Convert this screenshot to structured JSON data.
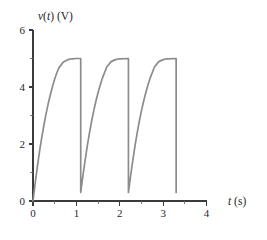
{
  "chart_data": {
    "type": "line",
    "title": "",
    "subtitle": "",
    "xlabel": "t (s)",
    "ylabel": "v(t) (V)",
    "xlabel_parts": {
      "italic": "t",
      "rest": " (s)"
    },
    "ylabel_parts": {
      "italic_v": "v",
      "paren_t_open": "(",
      "italic_t": "t",
      "paren_t_close": ")",
      "unit": " (V)"
    },
    "xlim": [
      0,
      4
    ],
    "ylim": [
      0,
      6
    ],
    "x_ticks_major": [
      0,
      1,
      2,
      3,
      4
    ],
    "x_ticks_major_labels": [
      "0",
      "1",
      "2",
      "3",
      "4"
    ],
    "x_ticks_minor": [
      0.5,
      1.5,
      2.5,
      3.5
    ],
    "y_ticks_major": [
      0,
      2,
      4,
      6
    ],
    "y_ticks_major_labels": [
      "0",
      "2",
      "4",
      "6"
    ],
    "y_ticks_minor": [
      1,
      3,
      5
    ],
    "grid": false,
    "legend": null,
    "series": [
      {
        "name": "v(t)",
        "color": "#8c8c8c",
        "waveform": "sawtooth-exponential-charge",
        "period": 1.1,
        "peak_value": 5.0,
        "reset_value": 0.3,
        "start_value": 0.0,
        "time_constant": 0.62,
        "n_cycles": 3,
        "end_time": 3.3,
        "points": [
          [
            0.0,
            0.0
          ],
          [
            0.05,
            0.62
          ],
          [
            0.1,
            1.2
          ],
          [
            0.15,
            1.73
          ],
          [
            0.2,
            2.21
          ],
          [
            0.25,
            2.65
          ],
          [
            0.3,
            3.05
          ],
          [
            0.35,
            3.41
          ],
          [
            0.4,
            3.73
          ],
          [
            0.45,
            4.02
          ],
          [
            0.5,
            4.28
          ],
          [
            0.55,
            4.5
          ],
          [
            0.6,
            4.68
          ],
          [
            0.7,
            4.88
          ],
          [
            0.8,
            4.96
          ],
          [
            0.9,
            4.99
          ],
          [
            1.0,
            5.0
          ],
          [
            1.1,
            5.0
          ],
          [
            1.1,
            0.3
          ],
          [
            1.15,
            0.88
          ],
          [
            1.2,
            1.42
          ],
          [
            1.25,
            1.92
          ],
          [
            1.3,
            2.37
          ],
          [
            1.35,
            2.79
          ],
          [
            1.4,
            3.16
          ],
          [
            1.45,
            3.5
          ],
          [
            1.5,
            3.8
          ],
          [
            1.55,
            4.07
          ],
          [
            1.6,
            4.31
          ],
          [
            1.7,
            4.7
          ],
          [
            1.8,
            4.89
          ],
          [
            1.9,
            4.96
          ],
          [
            2.0,
            4.99
          ],
          [
            2.2,
            5.0
          ],
          [
            2.2,
            0.3
          ],
          [
            2.25,
            0.88
          ],
          [
            2.3,
            1.42
          ],
          [
            2.35,
            1.92
          ],
          [
            2.4,
            2.37
          ],
          [
            2.45,
            2.79
          ],
          [
            2.5,
            3.16
          ],
          [
            2.55,
            3.5
          ],
          [
            2.6,
            3.8
          ],
          [
            2.65,
            4.07
          ],
          [
            2.7,
            4.31
          ],
          [
            2.8,
            4.7
          ],
          [
            2.9,
            4.89
          ],
          [
            3.0,
            4.96
          ],
          [
            3.1,
            4.99
          ],
          [
            3.3,
            5.0
          ],
          [
            3.3,
            0.3
          ]
        ]
      }
    ]
  },
  "axes": {
    "axis_color": "#3b3b3b",
    "background": "#ffffff"
  }
}
